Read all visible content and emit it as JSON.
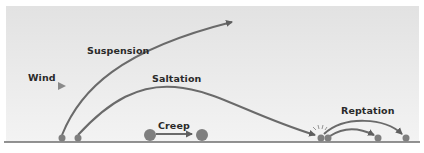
{
  "diagram": {
    "labels": {
      "wind": "Wind",
      "suspension": "Suspension",
      "saltation": "Saltation",
      "creep": "Creep",
      "reptation": "Reptation"
    },
    "colors": {
      "background_top": "#e4e4e4",
      "background_bottom": "#f2f2f2",
      "curve": "#6a6a6a",
      "particle": "#7f7f7f",
      "ground": "#6e6e6e",
      "wind_arrow": "#8a8a8a",
      "text": "#2a2a2a"
    },
    "processes": [
      {
        "name": "Suspension",
        "description": "Particle lifted high into air, arrow continues upward"
      },
      {
        "name": "Saltation",
        "description": "Particle hops in arc and impacts ground"
      },
      {
        "name": "Creep",
        "description": "Large particle rolls along surface"
      },
      {
        "name": "Reptation",
        "description": "Impact splashes nearby grains into short hops"
      }
    ]
  }
}
